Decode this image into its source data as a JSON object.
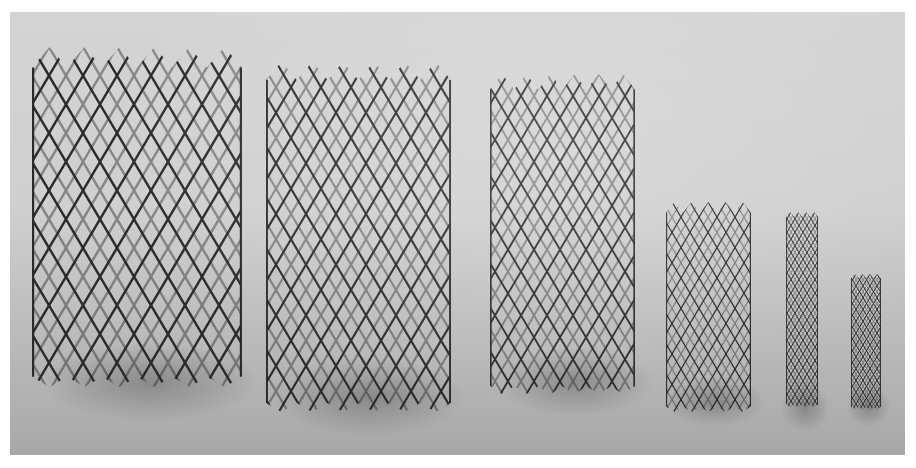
{
  "image": {
    "subject": "six metal mesh stents of decreasing size",
    "style": "grayscale photograph",
    "background_color": "#cfcfcf",
    "strut_color": "#2a2a2a"
  },
  "stents": [
    {
      "label": "stent-1",
      "x": 22,
      "y": 35,
      "w": 210,
      "h": 340,
      "cell": 34
    },
    {
      "label": "stent-2",
      "x": 256,
      "y": 50,
      "w": 185,
      "h": 350,
      "cell": 30
    },
    {
      "label": "stent-3",
      "x": 480,
      "y": 62,
      "w": 145,
      "h": 320,
      "cell": 26
    },
    {
      "label": "stent-4",
      "x": 656,
      "y": 190,
      "w": 85,
      "h": 210,
      "cell": 18
    },
    {
      "label": "stent-5",
      "x": 776,
      "y": 200,
      "w": 32,
      "h": 195,
      "cell": 8
    },
    {
      "label": "stent-6",
      "x": 841,
      "y": 262,
      "w": 30,
      "h": 135,
      "cell": 7
    }
  ]
}
